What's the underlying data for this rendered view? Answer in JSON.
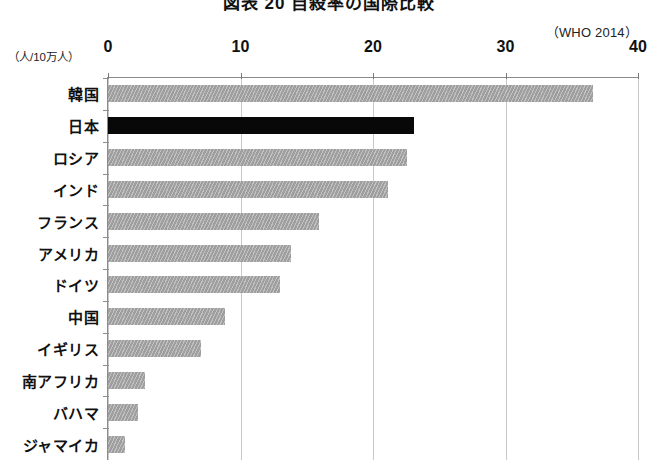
{
  "title": "図表 20  自殺率の国際比較",
  "source_note": "（WHO 2014）",
  "unit_caption": "（人/10万人）",
  "chart_data": {
    "type": "bar",
    "orientation": "horizontal",
    "title": "図表 20  自殺率の国際比較",
    "subtitle": "（WHO 2014）",
    "xlabel": "（人/10万人）",
    "ylabel": "",
    "xlim": [
      0,
      40
    ],
    "xticks": [
      0,
      10,
      20,
      30,
      40
    ],
    "xtick_labels": [
      "0",
      "10",
      "20",
      "30",
      "40"
    ],
    "grid": true,
    "legend": "none",
    "categories": [
      "韓国",
      "日本",
      "ロシア",
      "インド",
      "フランス",
      "アメリカ",
      "ドイツ",
      "中国",
      "イギリス",
      "南アフリカ",
      "バハマ",
      "ジャマイカ"
    ],
    "values": [
      36.6,
      23.1,
      22.6,
      21.1,
      15.9,
      13.8,
      13.0,
      8.8,
      7.0,
      2.8,
      2.3,
      1.3
    ],
    "highlight_index": 1,
    "colors": {
      "bar": "#a7a7a7",
      "bar_highlight": "#080808",
      "grid": "#c9c9c9",
      "axis": "#8a8a8a",
      "text": "#111111",
      "background": "#ffffff"
    }
  }
}
